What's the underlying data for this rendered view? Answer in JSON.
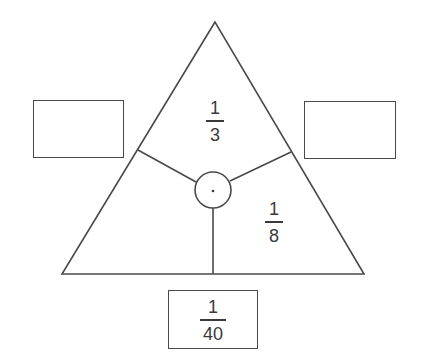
{
  "diagram": {
    "type": "fraction-triangle",
    "colors": {
      "stroke": "#4a4a4a",
      "text": "#3a3a3a",
      "background": "#ffffff"
    },
    "triangle": {
      "sections": {
        "top": {
          "numerator": "1",
          "denominator": "3"
        },
        "bottom_right": {
          "numerator": "1",
          "denominator": "8"
        },
        "bottom_left": {
          "numerator": "",
          "denominator": ""
        }
      },
      "center_symbol": "·"
    },
    "boxes": {
      "left": {
        "value": ""
      },
      "right": {
        "value": ""
      },
      "bottom": {
        "numerator": "1",
        "denominator": "40"
      }
    }
  }
}
